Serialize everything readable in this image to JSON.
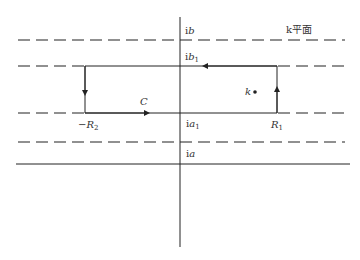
{
  "figure": {
    "plane_label": "k平面",
    "contour_label": "C",
    "point_label": "k",
    "labels": {
      "ib": {
        "prefix": "i",
        "var": "b",
        "sub": ""
      },
      "ib1": {
        "prefix": "i",
        "var": "b",
        "sub": "1"
      },
      "ia1": {
        "prefix": "i",
        "var": "a",
        "sub": "1"
      },
      "ia": {
        "prefix": "i",
        "var": "a",
        "sub": ""
      },
      "neg_R2": {
        "prefix": "−",
        "var": "R",
        "sub": "2"
      },
      "R1": {
        "prefix": "",
        "var": "R",
        "sub": "1"
      }
    },
    "colors": {
      "line": "#222222",
      "text": "#333333",
      "background": "#ffffff"
    }
  }
}
